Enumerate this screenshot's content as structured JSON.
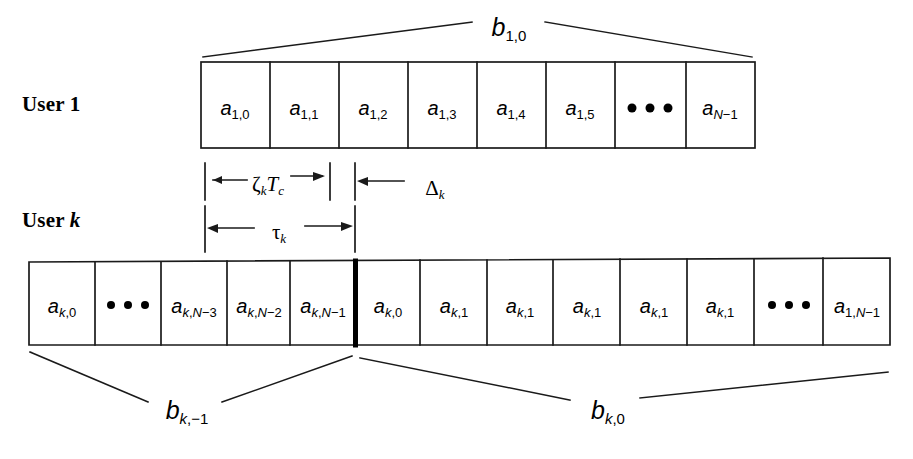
{
  "figure": {
    "type": "timing-diagram"
  },
  "rows": [
    {
      "id": "user1",
      "label_prefix": "User ",
      "label_suffix": "1",
      "label_suffix_italic": false,
      "bracket_label_base": "b",
      "bracket_label_sub": "1,0",
      "cells": [
        {
          "kind": "text",
          "base": "a",
          "sub": "1,0"
        },
        {
          "kind": "text",
          "base": "a",
          "sub": "1,1"
        },
        {
          "kind": "text",
          "base": "a",
          "sub": "1,2"
        },
        {
          "kind": "text",
          "base": "a",
          "sub": "1,3"
        },
        {
          "kind": "text",
          "base": "a",
          "sub": "1,4"
        },
        {
          "kind": "text",
          "base": "a",
          "sub": "1,5"
        },
        {
          "kind": "dots",
          "base": "",
          "sub": ""
        },
        {
          "kind": "text",
          "base": "a",
          "sub": "1,N−1",
          "sub_italic_part": "N"
        }
      ]
    },
    {
      "id": "userk",
      "label_prefix": "User ",
      "label_suffix": "k",
      "label_suffix_italic": true,
      "cells": [
        {
          "kind": "text",
          "base": "a",
          "sub": "k,0"
        },
        {
          "kind": "dots",
          "base": "",
          "sub": ""
        },
        {
          "kind": "text",
          "base": "a",
          "sub": "k,N−3",
          "sub_italic_part": "N"
        },
        {
          "kind": "text",
          "base": "a",
          "sub": "k,N−2",
          "sub_italic_part": "N"
        },
        {
          "kind": "text",
          "base": "a",
          "sub": "k,N−1",
          "sub_italic_part": "N"
        },
        {
          "kind": "text",
          "base": "a",
          "sub": "k,0"
        },
        {
          "kind": "text",
          "base": "a",
          "sub": "k,1"
        },
        {
          "kind": "text",
          "base": "a",
          "sub": "k,1"
        },
        {
          "kind": "text",
          "base": "a",
          "sub": "k,1"
        },
        {
          "kind": "text",
          "base": "a",
          "sub": "k,1"
        },
        {
          "kind": "text",
          "base": "a",
          "sub": "k,1"
        },
        {
          "kind": "dots",
          "base": "",
          "sub": ""
        },
        {
          "kind": "text",
          "base": "a",
          "sub": "1,N−1",
          "sub_italic_part": "N"
        }
      ],
      "bottom_labels": [
        {
          "base": "b",
          "sub": "k,−1"
        },
        {
          "base": "b",
          "sub": "k,0"
        }
      ]
    }
  ],
  "measurements": [
    {
      "id": "zeta-tc",
      "symbol": "ζ",
      "sub": "k",
      "trailing": "T",
      "trailing_sub": "c"
    },
    {
      "id": "delta-k",
      "symbol": "Δ",
      "sub": "k",
      "trailing": "",
      "trailing_sub": ""
    },
    {
      "id": "tau-k",
      "symbol": "τ",
      "sub": "k",
      "trailing": "",
      "trailing_sub": ""
    }
  ],
  "labels": {
    "user1_full": "User 1",
    "userk_full": "User k",
    "b10": "b1,0",
    "bk_minus1": "bk,-1",
    "bk0": "bk,0",
    "zeta_tc": "ζkTc",
    "delta_k": "Δk",
    "tau_k": "τk"
  },
  "colors": {
    "stroke": "#1a1a1a",
    "background": "#ffffff",
    "divider": "#000000"
  }
}
